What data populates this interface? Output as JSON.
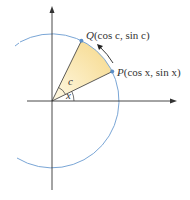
{
  "diagram": {
    "origin": [
      52,
      101
    ],
    "radius": 67,
    "colors": {
      "circle": "#7aa6d6",
      "axis": "#333333",
      "sector_fill": "#f6d98a",
      "point": "#5b8fc8",
      "arrow": "#222222"
    },
    "labels": {
      "q_letter": "Q",
      "q_coords": "(cos c, sin c)",
      "p_letter": "P",
      "p_coords": "(cos x, sin x)",
      "angle_c": "c",
      "angle_x": "x"
    },
    "points": {
      "P": {
        "angle_deg": 26
      },
      "Q": {
        "angle_deg": 64
      }
    }
  }
}
